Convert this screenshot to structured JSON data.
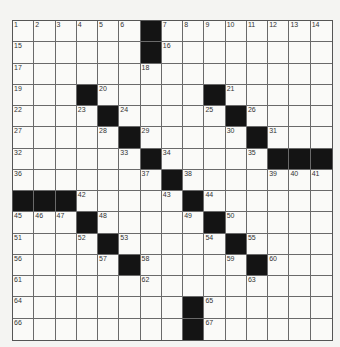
{
  "puzzle": {
    "rows": 15,
    "cols": 15,
    "colors": {
      "block": "#141414",
      "cell": "#fafaf8",
      "line": "#6a6a6a",
      "background": "#f4f4f2"
    },
    "layout": [
      "......#........",
      "......#........",
      "...............",
      "...#.....#.....",
      "....#....#.....",
      ".....#....#....",
      "......#....###",
      ".......#.......",
      "###.....#......",
      "...#.....#.....",
      "....#....#.....",
      ".....#....#....",
      "...............",
      "........#......",
      "........#......"
    ],
    "grid": [
      [
        "1",
        "2",
        "3",
        "4",
        "5",
        "6",
        "#",
        "7",
        "8",
        "9",
        "10",
        "11",
        "12",
        "13",
        "14"
      ],
      [
        "15",
        "",
        "",
        "",
        "",
        "",
        "#",
        "16",
        "",
        "",
        "",
        "",
        "",
        "",
        ""
      ],
      [
        "17",
        "",
        "",
        "",
        "",
        "",
        "18",
        "",
        "",
        "",
        "",
        "",
        "",
        "",
        ""
      ],
      [
        "19",
        "",
        "",
        "#",
        "20",
        "",
        "",
        "",
        "",
        "#",
        "21",
        "",
        "",
        "",
        ""
      ],
      [
        "22",
        "",
        "",
        "23",
        "#",
        "24",
        "",
        "",
        "",
        "25",
        "#",
        "26",
        "",
        "",
        ""
      ],
      [
        "27",
        "",
        "",
        "",
        "28",
        "#",
        "29",
        "",
        "",
        "",
        "30",
        "#",
        "31",
        "",
        ""
      ],
      [
        "32",
        "",
        "",
        "",
        "",
        "33",
        "#",
        "34",
        "",
        "",
        "",
        "35",
        "#",
        "#",
        "#"
      ],
      [
        "36",
        "",
        "",
        "",
        "",
        "",
        "37",
        "#",
        "38",
        "",
        "",
        "",
        "39",
        "40",
        "41"
      ],
      [
        "#",
        "#",
        "#",
        "42",
        "",
        "",
        "",
        "43",
        "#",
        "44",
        "",
        "",
        "",
        "",
        ""
      ],
      [
        "45",
        "46",
        "47",
        "#",
        "48",
        "",
        "",
        "",
        "49",
        "#",
        "50",
        "",
        "",
        "",
        ""
      ],
      [
        "51",
        "",
        "",
        "52",
        "#",
        "53",
        "",
        "",
        "",
        "54",
        "#",
        "55",
        "",
        "",
        ""
      ],
      [
        "56",
        "",
        "",
        "",
        "57",
        "#",
        "58",
        "",
        "",
        "",
        "59",
        "#",
        "60",
        "",
        ""
      ],
      [
        "61",
        "",
        "",
        "",
        "",
        "",
        "62",
        "",
        "",
        "",
        "",
        "63",
        "",
        "",
        ""
      ],
      [
        "64",
        "",
        "",
        "",
        "",
        "",
        "",
        "",
        "#",
        "65",
        "",
        "",
        "",
        "",
        ""
      ],
      [
        "66",
        "",
        "",
        "",
        "",
        "",
        "",
        "",
        "#",
        "67",
        "",
        "",
        "",
        "",
        ""
      ]
    ]
  }
}
